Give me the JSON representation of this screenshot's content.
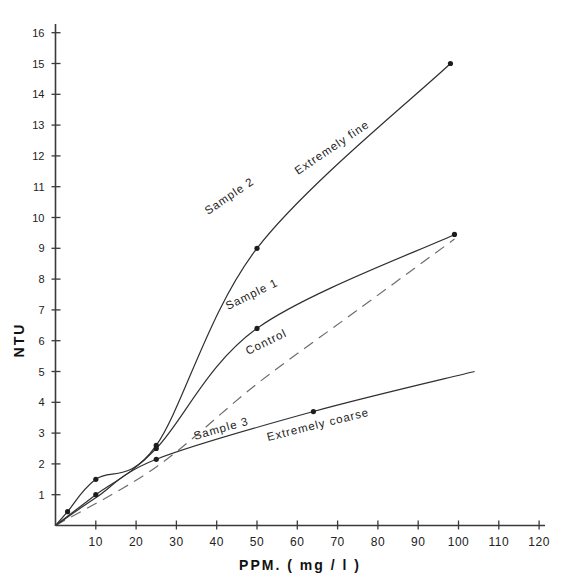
{
  "chart_data": {
    "type": "line",
    "title": "",
    "xlabel": "PPM. ( mg / l )",
    "ylabel": "NTU",
    "xlim": [
      0,
      124
    ],
    "ylim": [
      0,
      16.6
    ],
    "grid": false,
    "legend": "inline-curve-labels",
    "xticks": [
      10,
      20,
      30,
      40,
      50,
      60,
      70,
      80,
      90,
      100,
      110,
      120
    ],
    "xtick_labels": [
      "10",
      "20",
      "30",
      "40",
      "50",
      "60",
      "70",
      "80",
      "90",
      "100",
      "110",
      "120"
    ],
    "yticks": [
      1,
      2,
      3,
      4,
      5,
      6,
      7,
      8,
      9,
      10,
      11,
      12,
      13,
      14,
      15,
      16
    ],
    "ytick_labels": [
      "1",
      "2",
      "3",
      "4",
      "5",
      "6",
      "7",
      "8",
      "9",
      "10",
      "11",
      "12",
      "13",
      "14",
      "15",
      "16"
    ],
    "series": [
      {
        "name": "Sample 2",
        "label": "Sample 2",
        "label2": "Extremely fine",
        "style": "solid",
        "markers": true,
        "x": [
          0,
          3,
          10,
          25,
          50,
          98
        ],
        "values": [
          0,
          0.45,
          1.5,
          2.6,
          9.0,
          15.0
        ],
        "marker_x": [
          3,
          10,
          25,
          50,
          98
        ],
        "marker_y": [
          0.45,
          1.5,
          2.6,
          9.0,
          15.0
        ]
      },
      {
        "name": "Sample 1",
        "label": "Sample 1",
        "label2": "",
        "style": "solid",
        "markers": true,
        "x": [
          0,
          3,
          10,
          25,
          50,
          99
        ],
        "values": [
          0,
          0.3,
          1.0,
          2.5,
          6.4,
          9.45
        ],
        "marker_x": [
          10,
          25,
          50,
          99
        ],
        "marker_y": [
          1.0,
          2.5,
          6.4,
          9.45
        ]
      },
      {
        "name": "Control",
        "label": "Control",
        "label2": "",
        "style": "dashed",
        "markers": false,
        "x": [
          0,
          25,
          50,
          75,
          99
        ],
        "values": [
          0,
          1.9,
          4.6,
          7.0,
          9.3
        ]
      },
      {
        "name": "Sample 3",
        "label": "Sample 3",
        "label2": "Extremely coarse",
        "style": "solid",
        "markers": true,
        "x": [
          0,
          10,
          25,
          64,
          104
        ],
        "values": [
          0,
          0.9,
          2.15,
          3.7,
          5.0
        ],
        "marker_x": [
          25,
          64
        ],
        "marker_y": [
          2.15,
          3.7
        ]
      }
    ]
  },
  "axes": {
    "y_axis_name": "NTU",
    "x_axis_name": "PPM. ( mg / l )"
  }
}
